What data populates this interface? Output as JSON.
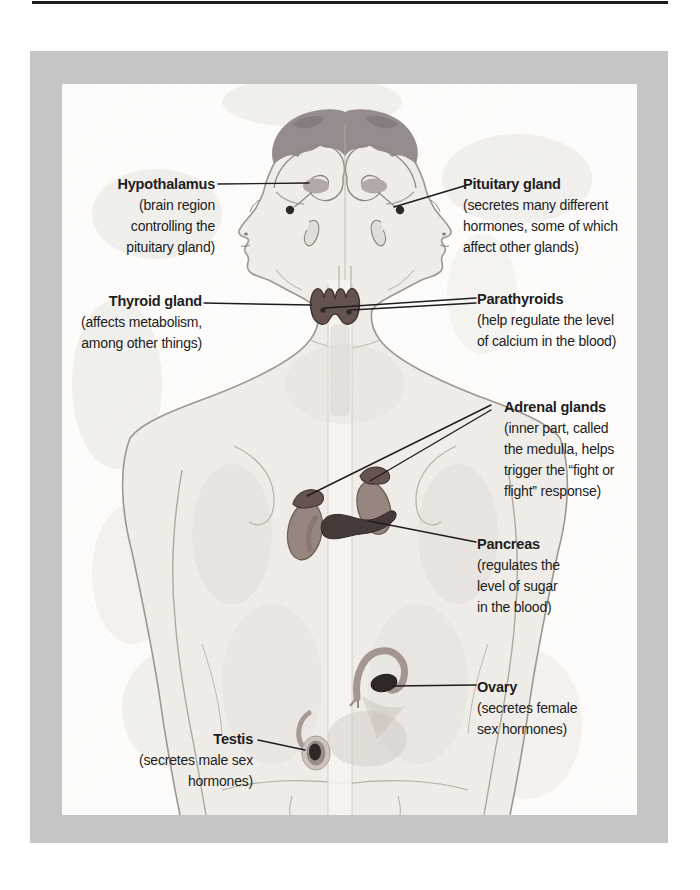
{
  "figure": {
    "colors": {
      "ink": "#1d1d1d",
      "frame_gray": "#c6c5c3",
      "paper": "#fdfcfa",
      "organ": "#655350",
      "organ_dark": "#2e2726",
      "kidney": "#97867f",
      "sketch_line": "#9f968f"
    },
    "labels": {
      "hypothalamus": {
        "name": "Hypothalamus",
        "desc": "(brain region\ncontrolling the\npituitary gland)"
      },
      "pituitary": {
        "name": "Pituitary gland",
        "desc": "(secretes many different\nhormones, some of which\naffect other glands)"
      },
      "thyroid": {
        "name": "Thyroid gland",
        "desc": "(affects metabolism,\namong other things)"
      },
      "parathyroids": {
        "name": "Parathyroids",
        "desc": "(help regulate the level\nof calcium in the blood)"
      },
      "adrenal": {
        "name": "Adrenal glands",
        "desc": "(inner part, called\nthe medulla, helps\ntrigger the “fight or\nflight” response)"
      },
      "pancreas": {
        "name": "Pancreas",
        "desc": "(regulates the\nlevel of sugar\nin the blood)"
      },
      "ovary": {
        "name": "Ovary",
        "desc": "(secretes female\nsex hormones)"
      },
      "testis": {
        "name": "Testis",
        "desc": "(secretes male sex\nhormones)"
      }
    }
  }
}
